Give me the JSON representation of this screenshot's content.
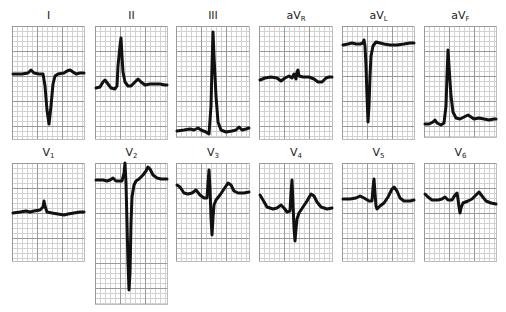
{
  "figure": {
    "type": "12-lead electrocardiogram",
    "trace_color": "#111111",
    "grid_major_color": "#9a9a9a",
    "grid_minor_color": "#d2d2d2"
  },
  "leads": [
    {
      "id": "I",
      "label_main": "I",
      "label_sub": ""
    },
    {
      "id": "II",
      "label_main": "II",
      "label_sub": ""
    },
    {
      "id": "III",
      "label_main": "III",
      "label_sub": ""
    },
    {
      "id": "aVR",
      "label_main": "aV",
      "label_sub": "R"
    },
    {
      "id": "aVL",
      "label_main": "aV",
      "label_sub": "L"
    },
    {
      "id": "aVF",
      "label_main": "aV",
      "label_sub": "F"
    },
    {
      "id": "V1",
      "label_main": "V",
      "label_sub": "1"
    },
    {
      "id": "V2",
      "label_main": "V",
      "label_sub": "2"
    },
    {
      "id": "V3",
      "label_main": "V",
      "label_sub": "3"
    },
    {
      "id": "V4",
      "label_main": "V",
      "label_sub": "4"
    },
    {
      "id": "V5",
      "label_main": "V",
      "label_sub": "5"
    },
    {
      "id": "V6",
      "label_main": "V",
      "label_sub": "6"
    }
  ]
}
